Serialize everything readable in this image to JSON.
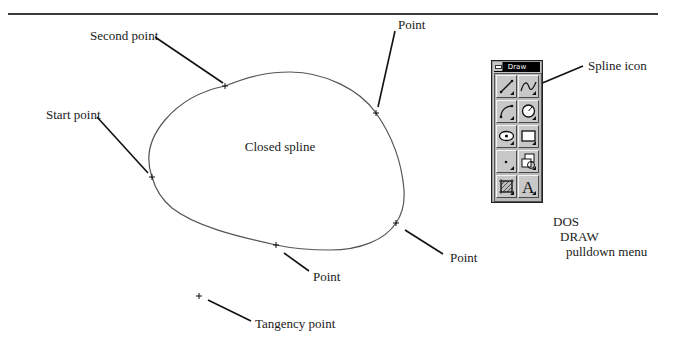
{
  "figure": {
    "shape_label": "Closed spline",
    "labels": {
      "second_point": "Second point",
      "start_point": "Start point",
      "point_top_right": "Point",
      "point_bottom_right": "Point",
      "point_bottom": "Point",
      "tangency_point": "Tangency point",
      "spline_icon": "Spline icon"
    },
    "caption": {
      "line1": "DOS",
      "line2": "DRAW",
      "line3": "pulldown menu"
    },
    "colors": {
      "curve": "#555555",
      "leader": "#111111",
      "rule": "#3a3a3a"
    }
  },
  "toolbox": {
    "title": "Draw",
    "buttons": [
      {
        "icon": "line-icon"
      },
      {
        "icon": "spline-icon"
      },
      {
        "icon": "arc-icon"
      },
      {
        "icon": "circle-icon"
      },
      {
        "icon": "ellipse-icon"
      },
      {
        "icon": "rectangle-icon"
      },
      {
        "icon": "point-icon"
      },
      {
        "icon": "polygon-icon"
      },
      {
        "icon": "hatch-icon"
      },
      {
        "icon": "text-icon"
      }
    ]
  }
}
